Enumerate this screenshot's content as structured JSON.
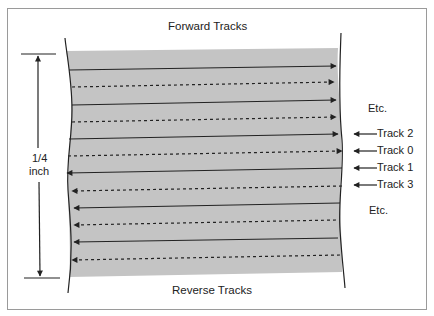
{
  "diagram": {
    "top_label": "Forward Tracks",
    "bottom_label": "Reverse Tracks",
    "dimension_label_line1": "1/4",
    "dimension_label_line2": "inch",
    "etc_top": "Etc.",
    "etc_bottom": "Etc.",
    "track_labels": [
      "Track 2",
      "Track 0",
      "Track 1",
      "Track 3"
    ],
    "tape_color": "#c4c4c4",
    "line_color": "#222222",
    "tracks": [
      {
        "direction": "forward",
        "style": "solid"
      },
      {
        "direction": "forward",
        "style": "dashed"
      },
      {
        "direction": "forward",
        "style": "solid"
      },
      {
        "direction": "forward",
        "style": "dashed"
      },
      {
        "direction": "forward",
        "style": "solid"
      },
      {
        "direction": "forward",
        "style": "dashed"
      },
      {
        "direction": "reverse",
        "style": "solid"
      },
      {
        "direction": "reverse",
        "style": "dashed"
      },
      {
        "direction": "reverse",
        "style": "solid"
      },
      {
        "direction": "reverse",
        "style": "dashed"
      },
      {
        "direction": "reverse",
        "style": "solid"
      },
      {
        "direction": "reverse",
        "style": "dashed"
      }
    ]
  }
}
